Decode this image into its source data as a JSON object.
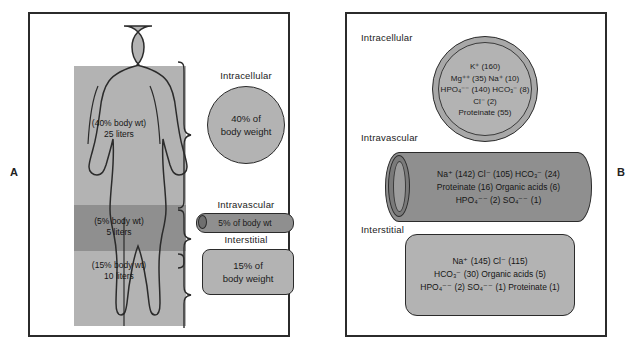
{
  "figure": {
    "panel_a_letter": "A",
    "panel_b_letter": "B"
  },
  "panel_a": {
    "body": {
      "intracellular_note": "(40% body wt)",
      "intracellular_volume": "25 liters",
      "intravascular_note": "(5% body wt)",
      "intravascular_volume": "5 liters",
      "interstitial_note": "(15% body wt)",
      "interstitial_volume": "10 liters"
    },
    "compartments": [
      {
        "label": "Intracellular",
        "shape": "circle",
        "line1": "40% of",
        "line2": "body weight"
      },
      {
        "label": "Intravascular",
        "shape": "cylinder",
        "line1": "5% of body wt",
        "line2": ""
      },
      {
        "label": "Interstitial",
        "shape": "rounded-rect",
        "line1": "15% of",
        "line2": "body weight"
      }
    ]
  },
  "panel_b": {
    "compartments": [
      {
        "label": "Intracellular",
        "shape": "double-circle",
        "lines": [
          "K⁺ (160)",
          "Mg⁺⁺ (35) Na⁺ (10)",
          "HPO₄⁻⁻ (140) HCO₃⁻ (8)",
          "Cl⁻ (2)",
          "Proteinate (55)"
        ]
      },
      {
        "label": "Intravascular",
        "shape": "cylinder",
        "lines": [
          "Na⁺ (142) Cl⁻ (105) HCO₃⁻ (24)",
          "Proteinate (16) Organic acids (6)",
          "HPO₄⁻⁻ (2) SO₄⁻⁻ (1)"
        ]
      },
      {
        "label": "Interstitial",
        "shape": "rounded-rect",
        "lines": [
          "Na⁺ (145) Cl⁻ (115)",
          "HCO₃⁻ (30) Organic acids (5)",
          "HPO₄⁻⁻ (2) SO₄⁻⁻ (1) Proteinate (1)"
        ]
      }
    ]
  },
  "colors": {
    "fill_light": "#b3b3b3",
    "fill_mid": "#a8a8a8",
    "fill_dark": "#8f8f8f",
    "outline": "#2b2b2b",
    "background": "#ffffff"
  }
}
